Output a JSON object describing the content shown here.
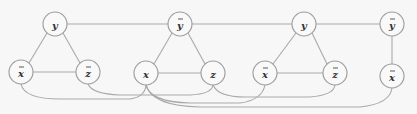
{
  "diagram": {
    "nodes": [
      {
        "id": "n1",
        "label": "y",
        "bar": false,
        "cx": 55,
        "cy": 24
      },
      {
        "id": "n2",
        "label": "y",
        "bar": true,
        "cx": 180,
        "cy": 24
      },
      {
        "id": "n3",
        "label": "y",
        "bar": false,
        "cx": 304,
        "cy": 24
      },
      {
        "id": "n4",
        "label": "y",
        "bar": true,
        "cx": 392,
        "cy": 24
      },
      {
        "id": "n5",
        "label": "x",
        "bar": true,
        "cx": 21,
        "cy": 72
      },
      {
        "id": "n6",
        "label": "z",
        "bar": true,
        "cx": 88,
        "cy": 72
      },
      {
        "id": "n7",
        "label": "x",
        "bar": false,
        "cx": 146,
        "cy": 73
      },
      {
        "id": "n8",
        "label": "z",
        "bar": false,
        "cx": 213,
        "cy": 73
      },
      {
        "id": "n9",
        "label": "x",
        "bar": true,
        "cx": 265,
        "cy": 73
      },
      {
        "id": "n10",
        "label": "z",
        "bar": true,
        "cx": 335,
        "cy": 73
      },
      {
        "id": "n11",
        "label": "x",
        "bar": true,
        "cx": 392,
        "cy": 76
      }
    ],
    "node_radius": 12,
    "colors": {
      "edge": "#a9a9a9",
      "node_stroke": "#9c9c9c",
      "node_fill": "#f9f9f9",
      "text": "#333333"
    }
  }
}
